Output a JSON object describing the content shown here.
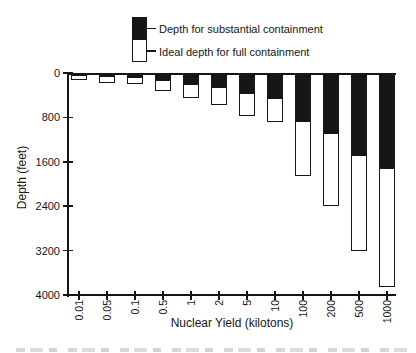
{
  "legend": {
    "items": [
      {
        "label": "Depth for substantial containment",
        "swatch_color": "#000000"
      },
      {
        "label": "Ideal depth for full containment",
        "swatch_color": "#ffffff"
      }
    ]
  },
  "chart_data": {
    "type": "bar",
    "title": "",
    "xlabel": "Nuclear Yield (kilotons)",
    "ylabel": "Depth (feet)",
    "y_axis_inverted": true,
    "ylim": [
      0,
      4000
    ],
    "yticks": [
      0,
      800,
      1600,
      2400,
      3200,
      4000
    ],
    "grid": false,
    "legend_position": "top",
    "categories": [
      "0.01",
      "0.05",
      "0.1",
      "0.5",
      "1",
      "2",
      "5",
      "10",
      "100",
      "200",
      "500",
      "1000"
    ],
    "series": [
      {
        "name": "Depth for substantial containment",
        "color": "#000000",
        "values": [
          55,
          85,
          100,
          160,
          230,
          280,
          385,
          475,
          900,
          1100,
          1510,
          1740
        ]
      },
      {
        "name": "Ideal depth for full containment",
        "color": "#ffffff",
        "values": [
          125,
          175,
          200,
          320,
          450,
          585,
          770,
          880,
          1850,
          2400,
          3200,
          3850
        ]
      }
    ]
  }
}
